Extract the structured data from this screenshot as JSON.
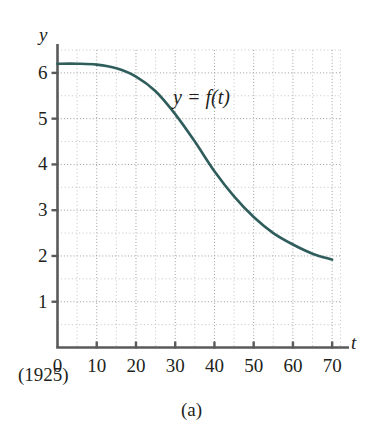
{
  "figure": {
    "caption": "(a)",
    "origin_note": "(1925)"
  },
  "chart_data": {
    "type": "line",
    "title": "",
    "xlabel": "t",
    "ylabel": "y",
    "curve_label": "y = f(t)",
    "xlim": [
      0,
      72
    ],
    "ylim": [
      0,
      6.5
    ],
    "xticks": [
      0,
      10,
      20,
      30,
      40,
      50,
      60,
      70
    ],
    "xtick_labels": [
      "0",
      "10",
      "20",
      "30",
      "40",
      "50",
      "60",
      "70"
    ],
    "yticks": [
      1,
      2,
      3,
      4,
      5,
      6
    ],
    "ytick_labels": [
      "1",
      "2",
      "3",
      "4",
      "5",
      "6"
    ],
    "grid": true,
    "grid_style": "dotted",
    "grid_x_minor_step": 5,
    "grid_y_minor_step": 0.5,
    "legend": "none",
    "series": [
      {
        "name": "y = f(t)",
        "color": "#2f5d5c",
        "x": [
          0,
          5,
          10,
          15,
          20,
          25,
          30,
          35,
          40,
          45,
          50,
          55,
          60,
          65,
          70
        ],
        "y": [
          6.2,
          6.2,
          6.18,
          6.1,
          5.92,
          5.6,
          5.1,
          4.5,
          3.85,
          3.3,
          2.85,
          2.5,
          2.25,
          2.05,
          1.92
        ]
      }
    ],
    "annotations": [
      {
        "text": "y = f(t)",
        "x": 32,
        "y": 5.45
      },
      {
        "text": "(1925)",
        "x": 0,
        "y": -0.75
      }
    ]
  }
}
